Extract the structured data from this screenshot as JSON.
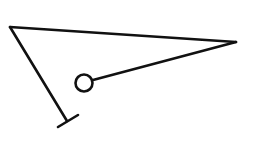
{
  "diagram": {
    "type": "line-drawing",
    "stroke_color": "#111111",
    "background": "#ffffff",
    "vertices": {
      "top_left": [
        10,
        27
      ],
      "right": [
        236,
        42
      ]
    },
    "circle": {
      "cx": 84,
      "cy": 83,
      "r": 9
    },
    "end_bar": {
      "x1": 57,
      "y1": 127,
      "x2": 78,
      "y2": 115
    },
    "end_point": [
      67,
      121
    ]
  }
}
